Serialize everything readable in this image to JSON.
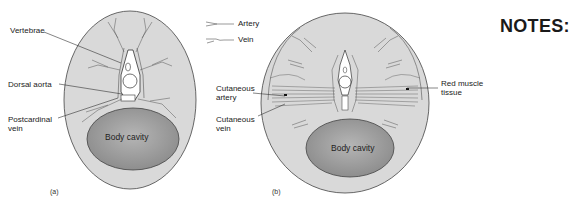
{
  "figure_a": {
    "labels": {
      "vertebrae": "Vertebrae",
      "dorsal_aorta": "Dorsal aorta",
      "postcardinal_vein": "Postcardinal\nvein",
      "body_cavity": "Body cavity"
    },
    "caption": "(a)"
  },
  "figure_b": {
    "labels": {
      "cutaneous_artery": "Cutaneous\nartery",
      "cutaneous_vein": "Cutaneous\nvein",
      "red_muscle_tissue": "Red muscle\ntissue",
      "body_cavity": "Body cavity"
    },
    "caption": "(b)"
  },
  "legend": {
    "items": [
      {
        "label": "Artery",
        "icon": "artery-line-icon"
      },
      {
        "label": "Vein",
        "icon": "vein-line-icon"
      }
    ]
  },
  "notes": {
    "title": "NOTES:"
  },
  "colors": {
    "body_fill": "#d9d9d9",
    "outline": "#3a3a3a",
    "cavity_fill": "#9a9a9a"
  }
}
